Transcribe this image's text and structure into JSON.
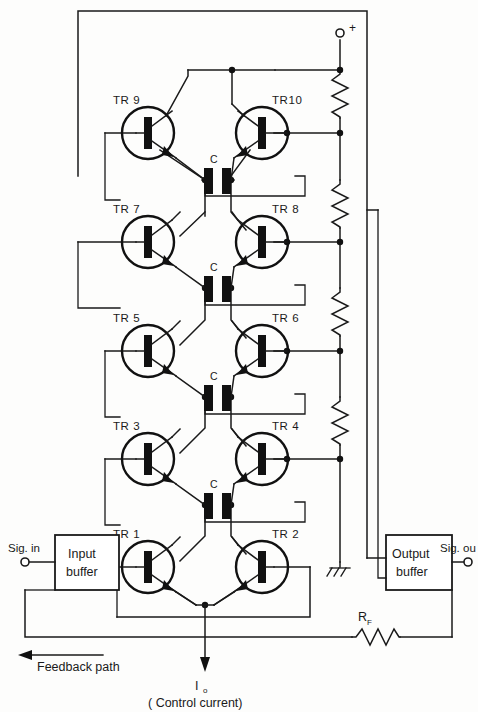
{
  "figure": {
    "kind": "electronic-schematic",
    "title_visible": false,
    "line_color": "#1a1a1a",
    "fill_color": "#111111",
    "background": "#fdfdfc"
  },
  "transistors": [
    {
      "name": "TR9",
      "label": "TR 9",
      "side": "left",
      "row": 1,
      "cx": 148,
      "cy": 133
    },
    {
      "name": "TR10",
      "label": "TR10",
      "side": "right",
      "row": 1,
      "cx": 262,
      "cy": 133
    },
    {
      "name": "TR7",
      "label": "TR 7",
      "side": "left",
      "row": 2,
      "cx": 148,
      "cy": 242
    },
    {
      "name": "TR8",
      "label": "TR 8",
      "side": "right",
      "row": 2,
      "cx": 262,
      "cy": 242
    },
    {
      "name": "TR5",
      "label": "TR 5",
      "side": "left",
      "row": 3,
      "cx": 148,
      "cy": 351
    },
    {
      "name": "TR6",
      "label": "TR 6",
      "side": "right",
      "row": 3,
      "cx": 262,
      "cy": 351
    },
    {
      "name": "TR3",
      "label": "TR 3",
      "side": "left",
      "row": 4,
      "cx": 148,
      "cy": 459
    },
    {
      "name": "TR4",
      "label": "TR 4",
      "side": "right",
      "row": 4,
      "cx": 262,
      "cy": 459
    },
    {
      "name": "TR1",
      "label": "TR 1",
      "side": "left",
      "row": 5,
      "cx": 148,
      "cy": 567
    },
    {
      "name": "TR2",
      "label": "TR 2",
      "side": "right",
      "row": 5,
      "cx": 262,
      "cy": 567
    }
  ],
  "capacitors": [
    {
      "label": "C",
      "row": 1,
      "x": 205,
      "y": 180
    },
    {
      "label": "C",
      "row": 2,
      "x": 205,
      "y": 288
    },
    {
      "label": "C",
      "row": 3,
      "x": 205,
      "y": 397
    },
    {
      "label": "C",
      "row": 4,
      "x": 205,
      "y": 505
    }
  ],
  "resistors": [
    {
      "name": "bias-r1",
      "label": "",
      "orientation": "vertical",
      "x": 340,
      "y1": 70,
      "y2": 118
    },
    {
      "name": "bias-r2",
      "label": "",
      "orientation": "vertical",
      "x": 340,
      "y1": 180,
      "y2": 228
    },
    {
      "name": "bias-r3",
      "label": "",
      "orientation": "vertical",
      "x": 340,
      "y1": 288,
      "y2": 336
    },
    {
      "name": "bias-r4",
      "label": "",
      "orientation": "vertical",
      "x": 340,
      "y1": 397,
      "y2": 445
    },
    {
      "name": "feedback-resistor",
      "label": "R",
      "sub": "F",
      "orientation": "horizontal",
      "y": 637,
      "x1": 352,
      "x2": 400
    }
  ],
  "terminals": [
    {
      "name": "supply-positive",
      "label": "+",
      "x": 340,
      "y": 33,
      "label_dx": 8,
      "label_dy": -3
    },
    {
      "name": "signal-in",
      "label": "Sig. in",
      "x": 25,
      "y": 562,
      "label_dx": -10,
      "label_dy": -12
    },
    {
      "name": "signal-out",
      "label": "Sig. ou",
      "x": 468,
      "y": 562,
      "label_dx": -18,
      "label_dy": -12
    }
  ],
  "boxes": [
    {
      "name": "input-buffer",
      "line1": "Input",
      "line2": "buffer",
      "x": 55,
      "y": 535,
      "w": 64,
      "h": 55
    },
    {
      "name": "output-buffer",
      "line1": "Output",
      "line2": "buffer",
      "x": 386,
      "y": 535,
      "w": 66,
      "h": 55
    }
  ],
  "annotations": {
    "ground_label": "",
    "control_current_symbol": "I",
    "control_current_subscript": "o",
    "control_current_note": "( Control current)",
    "feedback_path": "Feedback path"
  }
}
